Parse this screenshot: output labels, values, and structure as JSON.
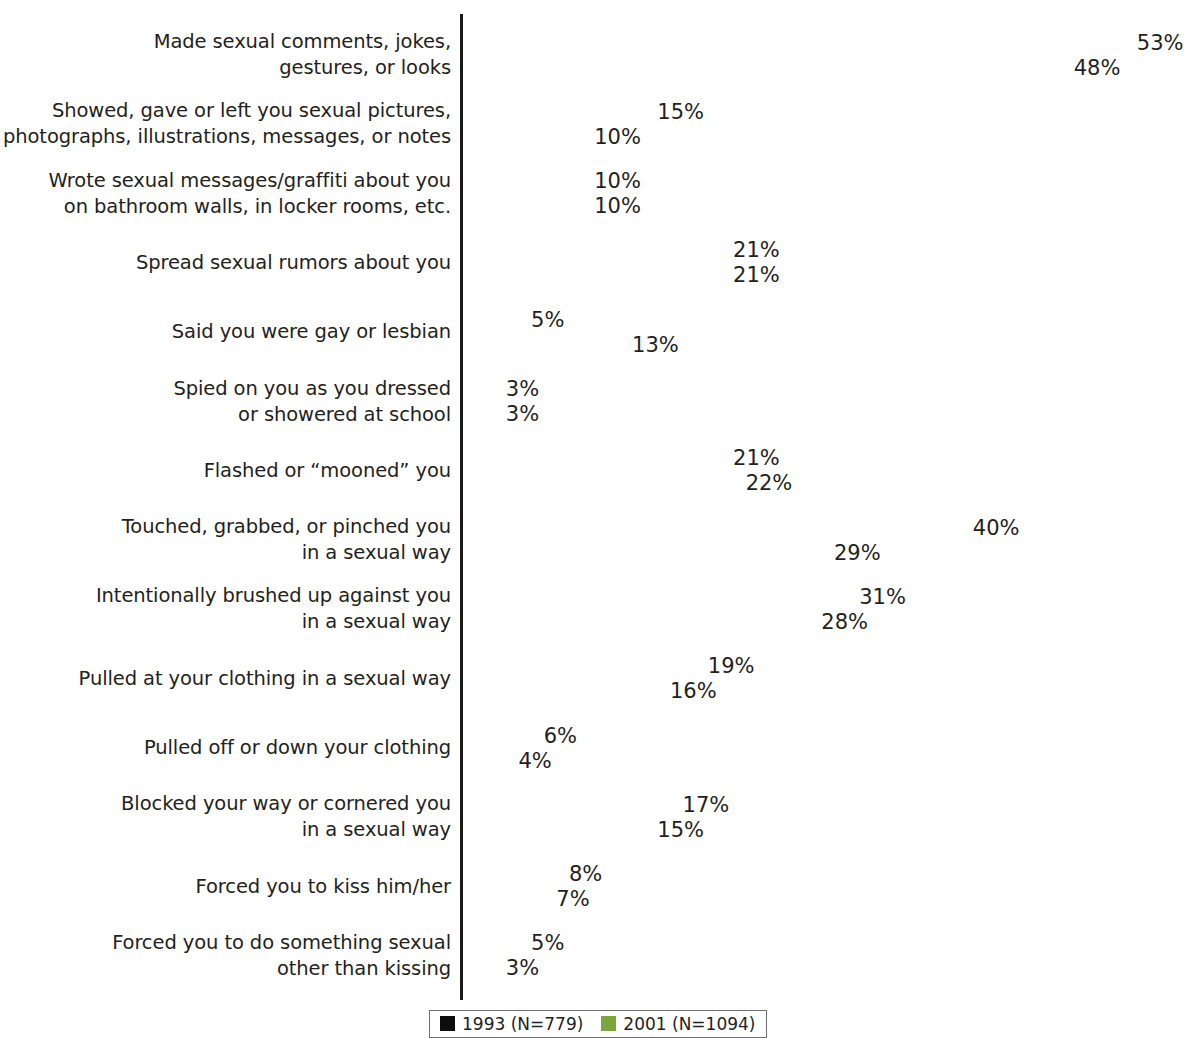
{
  "chart_data": {
    "type": "bar",
    "orientation": "horizontal",
    "title": "",
    "subtitle": "",
    "xlabel": "",
    "ylabel": "",
    "xlim": [
      0,
      53
    ],
    "grid": false,
    "legend_position": "bottom",
    "value_suffix": "%",
    "categories": [
      "Made sexual comments, jokes,\ngestures, or looks",
      "Showed, gave or left you sexual pictures,\nphotographs, illustrations, messages, or notes",
      "Wrote sexual messages/graffiti about you\non bathroom walls, in locker rooms, etc.",
      "Spread sexual rumors about you",
      "Said you were gay or lesbian",
      "Spied on you as you dressed\nor showered at school",
      "Flashed or “mooned” you",
      "Touched, grabbed, or pinched you\nin a sexual way",
      "Intentionally brushed up against you\nin a sexual way",
      "Pulled at your clothing in a sexual way",
      "Pulled off or down your clothing",
      "Blocked your way or cornered you\nin a sexual way",
      "Forced you to kiss him/her",
      "Forced you to do something sexual\nother than kissing"
    ],
    "series": [
      {
        "name": "1993 (N=779)",
        "color": "#0d0d0d",
        "values": [
          53,
          15,
          10,
          21,
          5,
          3,
          21,
          40,
          31,
          19,
          6,
          17,
          8,
          5
        ],
        "labels": [
          "53%",
          "15%",
          "10%",
          "21%",
          "5%",
          "3%",
          "21%",
          "40%",
          "31%",
          "19%",
          "6%",
          "17%",
          "8%",
          "5%"
        ]
      },
      {
        "name": "2001 (N=1094)",
        "color": "#7aa63c",
        "values": [
          48,
          10,
          10,
          21,
          13,
          3,
          22,
          29,
          28,
          16,
          4,
          15,
          7,
          3
        ],
        "labels": [
          "48%",
          "10%",
          "10%",
          "21%",
          "13%",
          "3%",
          "22%",
          "29%",
          "28%",
          "16%",
          "4%",
          "15%",
          "7%",
          "3%"
        ]
      }
    ]
  },
  "legend": {
    "entries": [
      {
        "label": "1993 (N=779)",
        "color": "#0d0d0d"
      },
      {
        "label": "2001 (N=1094)",
        "color": "#7aa63c"
      }
    ]
  }
}
